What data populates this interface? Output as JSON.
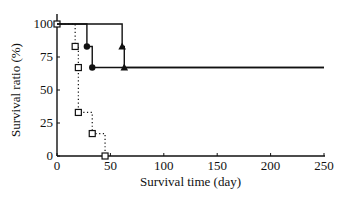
{
  "chart_data": {
    "type": "line",
    "subtype": "kaplan-meier step",
    "title": "",
    "xlabel": "Survival time (day)",
    "ylabel": "Survival ratio (%)",
    "xlim": [
      0,
      250
    ],
    "ylim": [
      0,
      100
    ],
    "xticks": [
      0,
      50,
      100,
      150,
      200,
      250
    ],
    "yticks": [
      0,
      25,
      50,
      75,
      100
    ],
    "grid": false,
    "legend": null,
    "series": [
      {
        "name": "open-square-dotted",
        "marker": "square-open",
        "line": "dotted",
        "steps": [
          [
            0,
            100
          ],
          [
            17,
            83
          ],
          [
            20,
            67
          ],
          [
            20,
            33
          ],
          [
            33,
            17
          ],
          [
            45,
            0
          ]
        ]
      },
      {
        "name": "filled-circle-solid",
        "marker": "circle-filled",
        "line": "solid",
        "steps": [
          [
            0,
            100
          ],
          [
            28,
            83
          ],
          [
            33,
            67
          ],
          [
            250,
            67
          ]
        ]
      },
      {
        "name": "filled-triangle-solid",
        "marker": "triangle-filled",
        "line": "solid",
        "steps": [
          [
            0,
            100
          ],
          [
            61,
            83
          ],
          [
            63,
            67
          ],
          [
            250,
            67
          ]
        ]
      }
    ]
  }
}
